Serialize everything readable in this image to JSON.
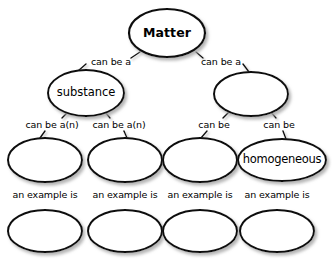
{
  "diagram": {
    "title": "Matter",
    "type": "concept-map",
    "background_color": "#ffffff",
    "node_fill": "#ffffff",
    "node_stroke": "#111111",
    "shadow_color": "#b4b4b4",
    "nodes": [
      {
        "id": "matter",
        "label": "Matter",
        "cx": 167,
        "cy": 33,
        "rx": 38,
        "ry": 24,
        "style": "root",
        "filled": true
      },
      {
        "id": "substance",
        "label": "substance",
        "cx": 86,
        "cy": 93,
        "rx": 38,
        "ry": 23,
        "style": "branch",
        "filled": true
      },
      {
        "id": "mixture",
        "label": "",
        "cx": 251,
        "cy": 94,
        "rx": 37,
        "ry": 22,
        "style": "branch",
        "filled": false
      },
      {
        "id": "element",
        "label": "",
        "cx": 45,
        "cy": 160,
        "rx": 37,
        "ry": 22,
        "style": "leaf",
        "filled": false
      },
      {
        "id": "compound",
        "label": "",
        "cx": 125,
        "cy": 160,
        "rx": 37,
        "ry": 22,
        "style": "leaf",
        "filled": false
      },
      {
        "id": "heterogeneous",
        "label": "",
        "cx": 200,
        "cy": 160,
        "rx": 37,
        "ry": 22,
        "style": "leaf",
        "filled": false
      },
      {
        "id": "homogeneous",
        "label": "homogeneous",
        "cx": 282,
        "cy": 160,
        "rx": 44,
        "ry": 21,
        "style": "leaf",
        "filled": true
      },
      {
        "id": "example-1",
        "label": "",
        "cx": 45,
        "cy": 231,
        "rx": 37,
        "ry": 21,
        "style": "leaf",
        "filled": false
      },
      {
        "id": "example-2",
        "label": "",
        "cx": 125,
        "cy": 231,
        "rx": 37,
        "ry": 21,
        "style": "leaf",
        "filled": false
      },
      {
        "id": "example-3",
        "label": "",
        "cx": 200,
        "cy": 231,
        "rx": 37,
        "ry": 21,
        "style": "leaf",
        "filled": false
      },
      {
        "id": "example-4",
        "label": "",
        "cx": 277,
        "cy": 231,
        "rx": 37,
        "ry": 21,
        "style": "leaf",
        "filled": false
      }
    ],
    "edges": [
      {
        "id": "matter-substance",
        "label": "can be a",
        "from": "matter",
        "to": "substance",
        "label_x": 88,
        "label_y": 56,
        "label_w": 46,
        "seg_a": {
          "x1": 140,
          "y1": 52,
          "x2": 131,
          "y2": 58
        },
        "seg_b": {
          "x1": 86,
          "y1": 64,
          "x2": 78,
          "y2": 71
        }
      },
      {
        "id": "matter-mixture",
        "label": "can be a",
        "from": "matter",
        "to": "mixture",
        "label_x": 198,
        "label_y": 56,
        "label_w": 46,
        "seg_a": {
          "x1": 196,
          "y1": 52,
          "x2": 203,
          "y2": 58
        },
        "seg_b": {
          "x1": 243,
          "y1": 64,
          "x2": 249,
          "y2": 72
        }
      },
      {
        "id": "substance-element",
        "label": "can be a(n)",
        "from": "substance",
        "to": "element",
        "label_x": 24,
        "label_y": 119,
        "label_w": 56,
        "seg_a": {
          "x1": 68,
          "y1": 112,
          "x2": 62,
          "y2": 118
        },
        "seg_b": {
          "x1": 45,
          "y1": 131,
          "x2": 40,
          "y2": 138
        }
      },
      {
        "id": "substance-compound",
        "label": "can be a(n)",
        "from": "substance",
        "to": "compound",
        "label_x": 91,
        "label_y": 119,
        "label_w": 56,
        "seg_a": {
          "x1": 105,
          "y1": 112,
          "x2": 110,
          "y2": 118
        },
        "seg_b": {
          "x1": 124,
          "y1": 131,
          "x2": 127,
          "y2": 138
        }
      },
      {
        "id": "mixture-heterogeneous",
        "label": "can be",
        "from": "mixture",
        "to": "heterogeneous",
        "label_x": 194,
        "label_y": 119,
        "label_w": 40,
        "seg_a": {
          "x1": 230,
          "y1": 111,
          "x2": 223,
          "y2": 118
        },
        "seg_b": {
          "x1": 207,
          "y1": 131,
          "x2": 201,
          "y2": 138
        }
      },
      {
        "id": "mixture-homogeneous",
        "label": "can be",
        "from": "mixture",
        "to": "homogeneous",
        "label_x": 259,
        "label_y": 119,
        "label_w": 40,
        "seg_a": {
          "x1": 270,
          "y1": 111,
          "x2": 276,
          "y2": 118
        },
        "seg_b": {
          "x1": 283,
          "y1": 131,
          "x2": 286,
          "y2": 139
        }
      },
      {
        "id": "element-example",
        "label": "an example is",
        "from": "element",
        "to": "example-1",
        "label_x": 6,
        "label_y": 189,
        "label_w": 78,
        "seg_a": {
          "x1": 45,
          "y1": 182,
          "x2": 45,
          "y2": 188
        },
        "seg_b": {
          "x1": 45,
          "y1": 202,
          "x2": 45,
          "y2": 210
        }
      },
      {
        "id": "compound-example",
        "label": "an example is",
        "from": "compound",
        "to": "example-2",
        "label_x": 86,
        "label_y": 189,
        "label_w": 78,
        "seg_a": {
          "x1": 125,
          "y1": 182,
          "x2": 125,
          "y2": 188
        },
        "seg_b": {
          "x1": 125,
          "y1": 202,
          "x2": 125,
          "y2": 210
        }
      },
      {
        "id": "heterogeneous-example",
        "label": "an example is",
        "from": "heterogeneous",
        "to": "example-3",
        "label_x": 161,
        "label_y": 189,
        "label_w": 78,
        "seg_a": {
          "x1": 200,
          "y1": 182,
          "x2": 200,
          "y2": 188
        },
        "seg_b": {
          "x1": 200,
          "y1": 202,
          "x2": 200,
          "y2": 210
        }
      },
      {
        "id": "homogeneous-example",
        "label": "an example is",
        "from": "homogeneous",
        "to": "example-4",
        "label_x": 238,
        "label_y": 189,
        "label_w": 78,
        "seg_a": {
          "x1": 277,
          "y1": 181,
          "x2": 277,
          "y2": 188
        },
        "seg_b": {
          "x1": 277,
          "y1": 202,
          "x2": 277,
          "y2": 210
        }
      }
    ]
  }
}
